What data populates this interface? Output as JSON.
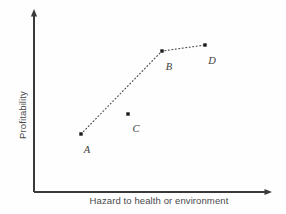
{
  "chart_data": {
    "type": "scatter",
    "title": "",
    "subtitle": "",
    "xlabel": "Hazard to health or environment",
    "ylabel": "Profitability",
    "grid": false,
    "legend": null,
    "axes": {
      "x_axis_ticks": [],
      "y_axis_ticks": [],
      "x_axis_arrow": true,
      "y_axis_arrow": true,
      "xlim_note": "unlabeled qualitative axis, increasing to the right",
      "ylim_note": "unlabeled qualitative axis, increasing upward"
    },
    "points": [
      {
        "label": "A",
        "x": 0.2,
        "y": 0.32,
        "px": 81,
        "py": 134,
        "label_px": 87,
        "label_py": 149,
        "on_frontier": true
      },
      {
        "label": "B",
        "x": 0.54,
        "y": 0.77,
        "px": 162,
        "py": 51,
        "label_px": 169,
        "label_py": 66,
        "on_frontier": true
      },
      {
        "label": "C",
        "x": 0.4,
        "y": 0.43,
        "px": 128,
        "py": 114,
        "label_px": 136,
        "label_py": 128,
        "on_frontier": false
      },
      {
        "label": "D",
        "x": 0.72,
        "y": 0.81,
        "px": 205,
        "py": 45,
        "label_px": 212,
        "label_py": 60,
        "on_frontier": true
      }
    ],
    "connector": {
      "style": "dotted",
      "sequence": [
        "A",
        "B",
        "D"
      ],
      "note": "Point C lies below the dotted frontier and is not connected"
    },
    "colors": {
      "background": "#fefefe",
      "axis": "#3a3a3a",
      "marker": "#1a1a1a",
      "connector": "#4d4d4d",
      "axis_label_text": "#4a4a4a",
      "point_label_text": "#3b3b3b"
    }
  }
}
